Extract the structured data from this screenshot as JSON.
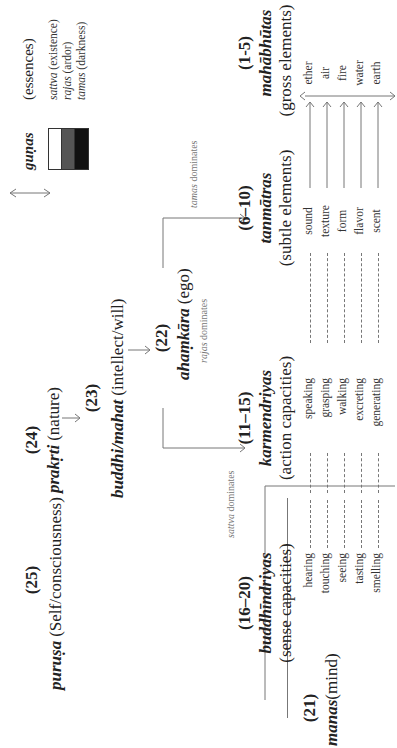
{
  "purusa": {
    "number": "(25)",
    "term": "puruṣa",
    "gloss": "(Self/consciousness)"
  },
  "prakrti": {
    "number": "(24)",
    "term": "prakṛti",
    "gloss": "(nature)"
  },
  "buddhi": {
    "number": "(23)",
    "term": "buddhi/mahat",
    "gloss": "(intellect/will)"
  },
  "ahamkara": {
    "number": "(22)",
    "term": "ahaṃkāra",
    "gloss": "(ego)",
    "rajas_note_term": "rajas",
    "rajas_note_text": "dominates"
  },
  "branches": {
    "sattva_term": "sattva",
    "sattva_text": "dominates",
    "tamas_term": "tamas",
    "tamas_text": "dominates"
  },
  "gunas": {
    "title": "guṇas",
    "subtitle": "(essences)",
    "items": [
      {
        "term": "sattva",
        "gloss": "(existence)",
        "color": "#ffffff"
      },
      {
        "term": "rajas",
        "gloss": "(ardor)",
        "color": "#555555"
      },
      {
        "term": "tamas",
        "gloss": "(darkness)",
        "color": "#111111"
      }
    ]
  },
  "manas": {
    "number": "(21)",
    "term": "manas",
    "gloss": "(mind)"
  },
  "buddhindriyas": {
    "number": "(16–20)",
    "term": "buddhīndriyas",
    "gloss": "(sense capacities)",
    "items": [
      "hearing",
      "touching",
      "seeing",
      "tasting",
      "smelling"
    ]
  },
  "karmendriyas": {
    "number": "(11–15)",
    "term": "karmendriyas",
    "gloss": "(action capacities)",
    "items": [
      "speaking",
      "grasping",
      "walking",
      "excreting",
      "generating"
    ]
  },
  "tanmatras": {
    "number": "(6–10)",
    "term": "tanmātras",
    "gloss": "(subtle elements)",
    "items": [
      "sound",
      "texture",
      "form",
      "flavor",
      "scent"
    ]
  },
  "mahabhutas": {
    "number": "(1-5)",
    "term": "mahābhūtas",
    "gloss": "(gross elements)",
    "items": [
      "ether",
      "air",
      "fire",
      "water",
      "earth"
    ]
  }
}
